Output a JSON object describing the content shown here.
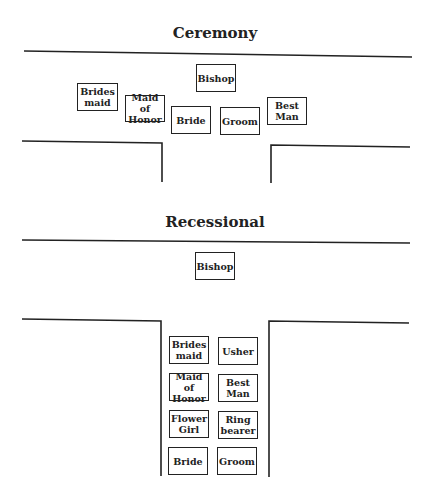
{
  "sections": {
    "ceremony": {
      "title": "Ceremony",
      "participants": [
        {
          "label": "Bishop",
          "x": 196,
          "y": 64,
          "w": 40,
          "h": 28
        },
        {
          "label": "Brides\nmaid",
          "x": 77,
          "y": 83,
          "w": 41,
          "h": 28
        },
        {
          "label": "Maid of\nHonor",
          "x": 125,
          "y": 95,
          "w": 40,
          "h": 27
        },
        {
          "label": "Bride",
          "x": 171,
          "y": 106,
          "w": 40,
          "h": 28
        },
        {
          "label": "Groom",
          "x": 220,
          "y": 107,
          "w": 40,
          "h": 28
        },
        {
          "label": "Best\nMan",
          "x": 267,
          "y": 97,
          "w": 40,
          "h": 28
        }
      ]
    },
    "recessional": {
      "title": "Recessional",
      "participants": [
        {
          "label": "Bishop",
          "x": 195,
          "y": 252,
          "w": 40,
          "h": 28
        },
        {
          "label": "Brides\nmaid",
          "x": 169,
          "y": 336,
          "w": 40,
          "h": 28
        },
        {
          "label": "Usher",
          "x": 218,
          "y": 337,
          "w": 40,
          "h": 28
        },
        {
          "label": "Maid of\nHonor",
          "x": 169,
          "y": 373,
          "w": 40,
          "h": 28
        },
        {
          "label": "Best\nMan",
          "x": 218,
          "y": 374,
          "w": 40,
          "h": 28
        },
        {
          "label": "Flower\nGirl",
          "x": 169,
          "y": 410,
          "w": 40,
          "h": 28
        },
        {
          "label": "Ring\nbearer",
          "x": 218,
          "y": 411,
          "w": 40,
          "h": 28
        },
        {
          "label": "Bride",
          "x": 168,
          "y": 447,
          "w": 40,
          "h": 28
        },
        {
          "label": "Groom",
          "x": 217,
          "y": 447,
          "w": 40,
          "h": 28
        }
      ]
    }
  }
}
